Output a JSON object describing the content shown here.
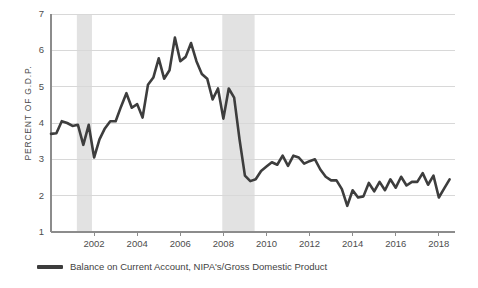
{
  "chart_data": {
    "type": "line",
    "title": "",
    "subtitle": "",
    "xlabel": "",
    "ylabel": "PERCENT OF G.D.P.",
    "xlim": [
      2000.0,
      2018.75
    ],
    "ylim": [
      1,
      7
    ],
    "grid": true,
    "grid_axis": "y",
    "legend_position": "bottom-left",
    "line_color": "#3d3d3d",
    "grid_color": "#d8d8d8",
    "axis_color": "#8c8c8c",
    "recession_band_color": "#e2e2e2",
    "background_color": "#ffffff",
    "yticks": [
      1,
      2,
      3,
      4,
      5,
      6,
      7
    ],
    "ytick_labels": [
      "1",
      "2",
      "3",
      "4",
      "5",
      "6",
      "7"
    ],
    "xticks": [
      2002,
      2004,
      2006,
      2008,
      2010,
      2012,
      2014,
      2016,
      2018
    ],
    "xtick_labels": [
      "2002",
      "2004",
      "2006",
      "2008",
      "2010",
      "2012",
      "2014",
      "2016",
      "2018"
    ],
    "shaded_regions": [
      {
        "label": "recession-2001",
        "start": 2001.2,
        "end": 2001.9
      },
      {
        "label": "recession-2008",
        "start": 2007.95,
        "end": 2009.45
      }
    ],
    "series": [
      {
        "name": "Balance on Current Account, NIPA's/Gross Domestic Product",
        "color": "#3d3d3d",
        "x": [
          2000.0,
          2000.25,
          2000.5,
          2000.75,
          2001.0,
          2001.25,
          2001.5,
          2001.75,
          2002.0,
          2002.25,
          2002.5,
          2002.75,
          2003.0,
          2003.25,
          2003.5,
          2003.75,
          2004.0,
          2004.25,
          2004.5,
          2004.75,
          2005.0,
          2005.25,
          2005.5,
          2005.75,
          2006.0,
          2006.25,
          2006.5,
          2006.75,
          2007.0,
          2007.25,
          2007.5,
          2007.75,
          2008.0,
          2008.25,
          2008.5,
          2008.75,
          2009.0,
          2009.25,
          2009.5,
          2009.75,
          2010.0,
          2010.25,
          2010.5,
          2010.75,
          2011.0,
          2011.25,
          2011.5,
          2011.75,
          2012.0,
          2012.25,
          2012.5,
          2012.75,
          2013.0,
          2013.25,
          2013.5,
          2013.75,
          2014.0,
          2014.25,
          2014.5,
          2014.75,
          2015.0,
          2015.25,
          2015.5,
          2015.75,
          2016.0,
          2016.25,
          2016.5,
          2016.75,
          2017.0,
          2017.25,
          2017.5,
          2017.75,
          2018.0,
          2018.25,
          2018.5
        ],
        "values": [
          3.7,
          3.72,
          4.05,
          4.0,
          3.92,
          3.95,
          3.4,
          3.95,
          3.05,
          3.55,
          3.85,
          4.05,
          4.05,
          4.45,
          4.82,
          4.42,
          4.52,
          4.15,
          5.05,
          5.25,
          5.78,
          5.22,
          5.45,
          6.35,
          5.7,
          5.82,
          6.2,
          5.7,
          5.35,
          5.22,
          4.65,
          4.95,
          4.12,
          4.95,
          4.7,
          3.55,
          2.55,
          2.4,
          2.45,
          2.68,
          2.8,
          2.92,
          2.85,
          3.1,
          2.82,
          3.1,
          3.05,
          2.88,
          2.95,
          3.0,
          2.72,
          2.52,
          2.42,
          2.42,
          2.18,
          1.72,
          2.15,
          1.95,
          1.98,
          2.35,
          2.12,
          2.38,
          2.15,
          2.45,
          2.22,
          2.52,
          2.28,
          2.38,
          2.38,
          2.62,
          2.3,
          2.55,
          1.95,
          2.2,
          2.45
        ]
      }
    ]
  },
  "legend": {
    "entries": [
      {
        "label": "Balance on Current Account, NIPA's/Gross Domestic Product",
        "color": "#3d3d3d"
      }
    ]
  },
  "axes": {
    "y_title": "PERCENT OF G.D.P."
  }
}
